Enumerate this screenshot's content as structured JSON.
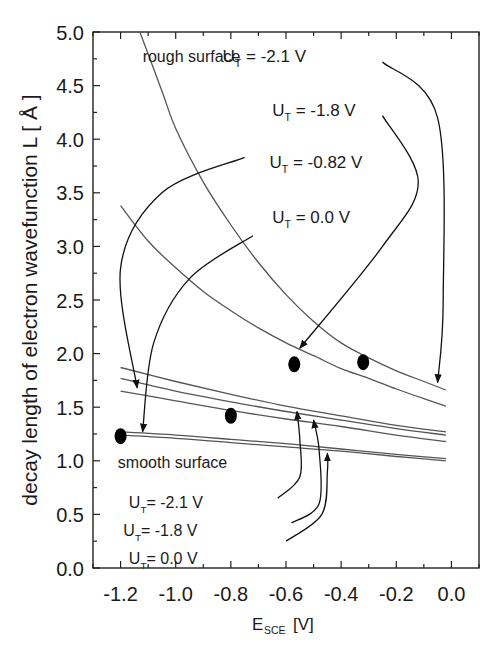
{
  "chart_data": {
    "type": "line",
    "title": "",
    "xlabel": "E",
    "xlabel_sub": "SCE",
    "xlabel_unit": " [V]",
    "ylabel": "decay length of electron wavefunction   L  [ Å ]",
    "xlim": [
      -1.3,
      0.1
    ],
    "ylim": [
      0.0,
      5.0
    ],
    "xticks": [
      -1.2,
      -1.0,
      -0.8,
      -0.6,
      -0.4,
      -0.2,
      0.0
    ],
    "xtick_labels": [
      "-1.2",
      "-1.0",
      "-0.8",
      "-0.6",
      "-0.4",
      "-0.2",
      "0.0"
    ],
    "yticks": [
      0.0,
      0.5,
      1.0,
      1.5,
      2.0,
      2.5,
      3.0,
      3.5,
      4.0,
      4.5,
      5.0
    ],
    "ytick_labels": [
      "0.0",
      "0.5",
      "1.0",
      "1.5",
      "2.0",
      "2.5",
      "3.0",
      "3.5",
      "4.0",
      "4.5",
      "5.0"
    ],
    "grid": false,
    "series": [
      {
        "name": "rough surface U_T = -2.1 V",
        "color": "#555555",
        "x": [
          -1.13,
          -1.05,
          -1.0,
          -0.9,
          -0.8,
          -0.7,
          -0.6,
          -0.5,
          -0.4,
          -0.3,
          -0.2,
          -0.1,
          -0.02
        ],
        "y": [
          5.0,
          4.45,
          4.1,
          3.6,
          3.2,
          2.85,
          2.55,
          2.3,
          2.1,
          1.96,
          1.84,
          1.74,
          1.66
        ]
      },
      {
        "name": "rough surface U_T = -1.8 V",
        "color": "#555555",
        "x": [
          -1.2,
          -1.1,
          -1.0,
          -0.9,
          -0.8,
          -0.7,
          -0.6,
          -0.5,
          -0.4,
          -0.3,
          -0.2,
          -0.1,
          -0.02
        ],
        "y": [
          3.38,
          3.05,
          2.8,
          2.58,
          2.4,
          2.24,
          2.1,
          1.98,
          1.86,
          1.77,
          1.67,
          1.58,
          1.51
        ]
      },
      {
        "name": "rough surface U_T = -0.82 V",
        "color": "#555555",
        "x": [
          -1.2,
          -1.0,
          -0.8,
          -0.6,
          -0.4,
          -0.2,
          -0.02
        ],
        "y": [
          1.87,
          1.74,
          1.62,
          1.51,
          1.42,
          1.33,
          1.27
        ]
      },
      {
        "name": "rough surface U_T = 0.0 V",
        "color": "#555555",
        "x": [
          -1.2,
          -1.0,
          -0.8,
          -0.6,
          -0.4,
          -0.2,
          -0.02
        ],
        "y": [
          1.77,
          1.65,
          1.55,
          1.46,
          1.38,
          1.3,
          1.24
        ]
      },
      {
        "name": "smooth surface U_T = -2.1 V",
        "color": "#555555",
        "x": [
          -1.2,
          -1.0,
          -0.8,
          -0.6,
          -0.4,
          -0.2,
          -0.02
        ],
        "y": [
          1.65,
          1.56,
          1.47,
          1.39,
          1.32,
          1.24,
          1.18
        ]
      },
      {
        "name": "smooth surface U_T = -1.8 V",
        "color": "#555555",
        "x": [
          -1.2,
          -1.0,
          -0.8,
          -0.6,
          -0.4,
          -0.2,
          -0.02
        ],
        "y": [
          1.27,
          1.24,
          1.2,
          1.16,
          1.11,
          1.06,
          1.02
        ]
      },
      {
        "name": "smooth surface U_T = 0.0 V",
        "color": "#555555",
        "x": [
          -1.2,
          -1.0,
          -0.8,
          -0.6,
          -0.4,
          -0.2,
          -0.02
        ],
        "y": [
          1.24,
          1.21,
          1.17,
          1.13,
          1.09,
          1.04,
          1.0
        ]
      }
    ],
    "markers": {
      "name": "measured",
      "color": "#000000",
      "x": [
        -1.2,
        -0.8,
        -0.57,
        -0.32
      ],
      "y": [
        1.23,
        1.42,
        1.9,
        1.92
      ]
    },
    "annotations": {
      "rough_header": "rough surface",
      "rough_labels": [
        {
          "prefix": "U",
          "sub": "T",
          "text": " = -2.1  V",
          "x": -0.83,
          "y": 4.72
        },
        {
          "prefix": "U",
          "sub": "T",
          "text": " = -1.8 V",
          "x": -0.65,
          "y": 4.22
        },
        {
          "prefix": "U",
          "sub": "T",
          "text": " = -0.82  V",
          "x": -0.66,
          "y": 3.73
        },
        {
          "prefix": "U",
          "sub": "T",
          "text": " = 0.0 V",
          "x": -0.65,
          "y": 3.22
        }
      ],
      "rough_header_pos": {
        "x": -1.12,
        "y": 4.72
      },
      "smooth_header": "smooth surface",
      "smooth_header_pos": {
        "x": -1.21,
        "y": 0.93
      },
      "smooth_labels": [
        {
          "prefix": "U",
          "sub": "T",
          "text": "= -2.1 V",
          "x": -1.17,
          "y": 0.56
        },
        {
          "prefix": "U",
          "sub": "T",
          "text": "= -1.8 V",
          "x": -1.19,
          "y": 0.3
        },
        {
          "prefix": "U",
          "sub": "T",
          "text": "=  0.0 V",
          "x": -1.17,
          "y": 0.04
        }
      ]
    },
    "arrows": [
      {
        "from": "rough -2.1 label",
        "path": [
          [
            -0.25,
            4.72
          ],
          [
            -0.05,
            4.2
          ],
          [
            -0.03,
            2.5
          ],
          [
            -0.05,
            1.73
          ]
        ]
      },
      {
        "from": "rough -1.8 label",
        "path": [
          [
            -0.25,
            4.22
          ],
          [
            -0.12,
            3.6
          ],
          [
            -0.25,
            3.0
          ],
          [
            -0.55,
            2.05
          ]
        ]
      },
      {
        "from": "rough -0.82 label",
        "path": [
          [
            -0.75,
            3.83
          ],
          [
            -1.05,
            3.5
          ],
          [
            -1.2,
            2.8
          ],
          [
            -1.14,
            1.68
          ]
        ]
      },
      {
        "from": "rough 0.0 label",
        "path": [
          [
            -0.72,
            3.1
          ],
          [
            -0.95,
            2.7
          ],
          [
            -1.08,
            2.1
          ],
          [
            -1.12,
            1.27
          ]
        ]
      },
      {
        "from": "smooth -2.1 label",
        "path": [
          [
            -0.63,
            0.65
          ],
          [
            -0.55,
            0.85
          ],
          [
            -0.55,
            1.2
          ],
          [
            -0.56,
            1.46
          ]
        ]
      },
      {
        "from": "smooth -1.8 label",
        "path": [
          [
            -0.58,
            0.42
          ],
          [
            -0.48,
            0.6
          ],
          [
            -0.48,
            1.1
          ],
          [
            -0.5,
            1.38
          ]
        ]
      },
      {
        "from": "smooth 0.0 label",
        "path": [
          [
            -0.6,
            0.25
          ],
          [
            -0.47,
            0.5
          ],
          [
            -0.45,
            0.9
          ],
          [
            -0.45,
            1.07
          ]
        ]
      }
    ]
  }
}
